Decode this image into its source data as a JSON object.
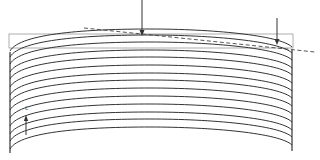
{
  "diagram": {
    "type": "layered-curved-surface",
    "labels": {
      "c_axis": "c"
    },
    "layers": {
      "count": 14,
      "center_x": 150,
      "center_y_values": [
        29,
        35,
        42,
        50,
        57,
        65,
        73,
        80,
        88,
        96,
        104,
        112,
        119,
        127
      ],
      "left_edge_x": 10,
      "right_edge_x": 292,
      "edge_drop": 18
    },
    "left_wall": {
      "x": 10,
      "y_top": 52,
      "y_bottom": 153
    },
    "right_wall": {
      "x": 292,
      "y_top": 50,
      "y_bottom": 151
    },
    "reference_box": {
      "x": 9,
      "y": 34,
      "width": 284,
      "height": 14
    },
    "arrows": [
      {
        "name": "top-load-arrow-center",
        "x": 142,
        "y1": 0,
        "y2": 35
      },
      {
        "name": "top-load-arrow-right",
        "x": 277,
        "y1": 18,
        "y2": 44
      }
    ],
    "c_axis_arrow": {
      "x": 26,
      "y1": 135,
      "y2": 116
    },
    "dashed_tangent": {
      "x1": 84,
      "y1": 28,
      "x2": 315,
      "y2": 52
    },
    "colors": {
      "line": "#333333",
      "box": "#888888",
      "dashed": "#444444",
      "background": "#ffffff"
    }
  }
}
